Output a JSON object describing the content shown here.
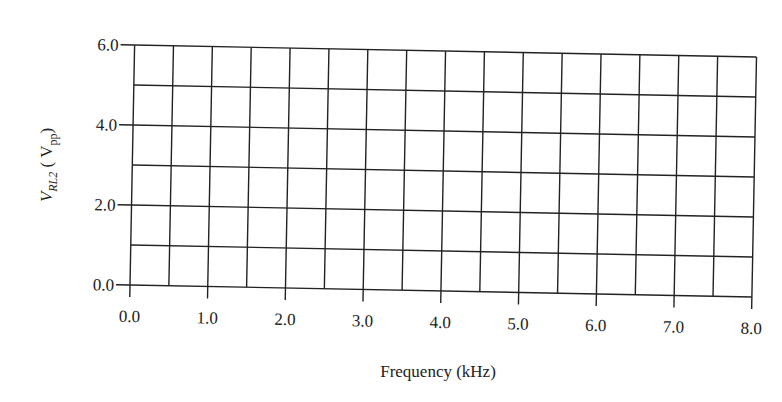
{
  "chart_data": {
    "type": "line",
    "title": "",
    "xlabel": "Frequency (kHz)",
    "ylabel": "V_RL2 (V_pp)",
    "ylabel_parts": {
      "main": "V",
      "sub": "RL2",
      "unit_main": "V",
      "unit_sub": "pp"
    },
    "xlim": [
      0,
      8
    ],
    "ylim": [
      0,
      6
    ],
    "x_ticks": [
      "0.0",
      "1.0",
      "2.0",
      "3.0",
      "4.0",
      "5.0",
      "6.0",
      "7.0",
      "8.0"
    ],
    "y_ticks": [
      "0.0",
      "2.0",
      "4.0",
      "6.0"
    ],
    "x_grid_step": 0.5,
    "y_grid_step": 1.0,
    "grid": true,
    "series": [],
    "legend": null
  }
}
